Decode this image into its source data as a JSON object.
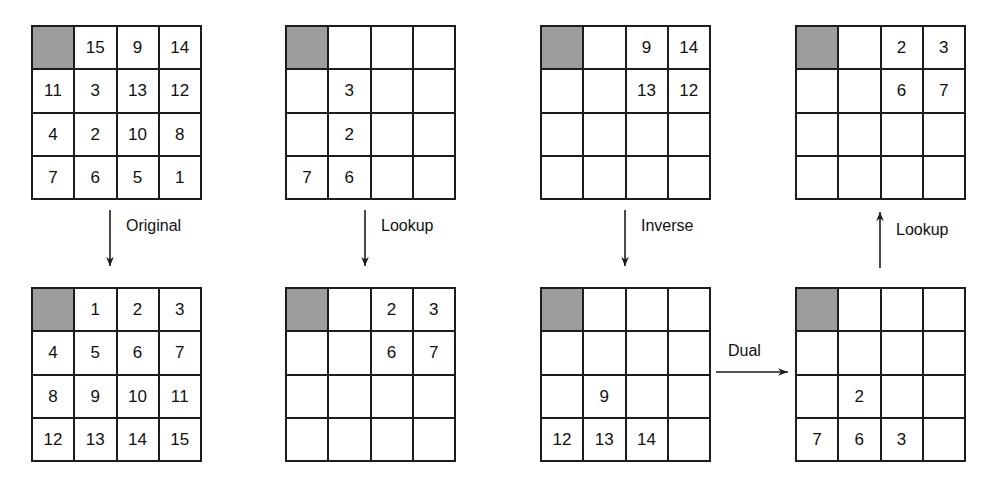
{
  "diagram": {
    "shaded_cell_color": "#9d9d9d",
    "line_color": "#1d1d1d",
    "grid_size": "4x4"
  },
  "grids": [
    {
      "id": "grid-original-scrambled",
      "name": "top-left-grid",
      "position": {
        "x": 31,
        "y": 25
      },
      "cells": [
        "",
        "15",
        "9",
        "14",
        "11",
        "3",
        "13",
        "12",
        "4",
        "2",
        "10",
        "8",
        "7",
        "6",
        "5",
        "1"
      ],
      "shaded_index": 0
    },
    {
      "id": "grid-lookup-scrambled",
      "name": "top-second-grid",
      "position": {
        "x": 285,
        "y": 25
      },
      "cells": [
        "",
        "",
        "",
        "",
        "",
        "3",
        "",
        "",
        "",
        "2",
        "",
        "",
        "7",
        "6",
        "",
        ""
      ],
      "shaded_index": 0
    },
    {
      "id": "grid-inverse-source",
      "name": "top-third-grid",
      "position": {
        "x": 540,
        "y": 25
      },
      "cells": [
        "",
        "",
        "9",
        "14",
        "",
        "",
        "13",
        "12",
        "",
        "",
        "",
        "",
        "",
        "",
        "",
        ""
      ],
      "shaded_index": 0
    },
    {
      "id": "grid-lookup-result",
      "name": "top-right-grid",
      "position": {
        "x": 795,
        "y": 25
      },
      "cells": [
        "",
        "",
        "2",
        "3",
        "",
        "",
        "6",
        "7",
        "",
        "",
        "",
        "",
        "",
        "",
        "",
        ""
      ],
      "shaded_index": 0
    },
    {
      "id": "grid-original-ordered",
      "name": "bottom-left-grid",
      "position": {
        "x": 31,
        "y": 287
      },
      "cells": [
        "",
        "1",
        "2",
        "3",
        "4",
        "5",
        "6",
        "7",
        "8",
        "9",
        "10",
        "11",
        "12",
        "13",
        "14",
        "15"
      ],
      "shaded_index": 0
    },
    {
      "id": "grid-lookup-ordered",
      "name": "bottom-second-grid",
      "position": {
        "x": 285,
        "y": 287
      },
      "cells": [
        "",
        "",
        "2",
        "3",
        "",
        "",
        "6",
        "7",
        "",
        "",
        "",
        "",
        "",
        "",
        "",
        ""
      ],
      "shaded_index": 0
    },
    {
      "id": "grid-inverse-result",
      "name": "bottom-third-grid",
      "position": {
        "x": 540,
        "y": 287
      },
      "cells": [
        "",
        "",
        "",
        "",
        "",
        "",
        "",
        "",
        "",
        "9",
        "",
        "",
        "12",
        "13",
        "14",
        ""
      ],
      "shaded_index": 0
    },
    {
      "id": "grid-dual-result",
      "name": "bottom-right-grid",
      "position": {
        "x": 795,
        "y": 287
      },
      "cells": [
        "",
        "",
        "",
        "",
        "",
        "",
        "",
        "",
        "",
        "2",
        "",
        "",
        "7",
        "6",
        "3",
        ""
      ],
      "shaded_index": 0
    }
  ],
  "arrows": [
    {
      "id": "arrow-original",
      "label": "Original",
      "direction": "down"
    },
    {
      "id": "arrow-lookup-left",
      "label": "Lookup",
      "direction": "down"
    },
    {
      "id": "arrow-inverse",
      "label": "Inverse",
      "direction": "down"
    },
    {
      "id": "arrow-lookup-right",
      "label": "Lookup",
      "direction": "up"
    },
    {
      "id": "arrow-dual",
      "label": "Dual",
      "direction": "right"
    }
  ]
}
